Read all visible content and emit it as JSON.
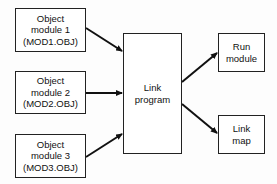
{
  "diagram": {
    "inputs": [
      {
        "lines": [
          "Object",
          "module 1",
          "(MOD1.OBJ)"
        ]
      },
      {
        "lines": [
          "Object",
          "module 2",
          "(MOD2.OBJ)"
        ]
      },
      {
        "lines": [
          "Object",
          "module 3",
          "(MOD3.OBJ)"
        ]
      }
    ],
    "processor": {
      "lines": [
        "Link",
        "program"
      ]
    },
    "outputs": [
      {
        "lines": [
          "Run",
          "module"
        ]
      },
      {
        "lines": [
          "Link",
          "map"
        ]
      }
    ],
    "edges": [
      {
        "from": "Object module 1",
        "to": "Link program"
      },
      {
        "from": "Object module 2",
        "to": "Link program"
      },
      {
        "from": "Object module 3",
        "to": "Link program"
      },
      {
        "from": "Link program",
        "to": "Run module"
      },
      {
        "from": "Link program",
        "to": "Link map"
      }
    ]
  }
}
